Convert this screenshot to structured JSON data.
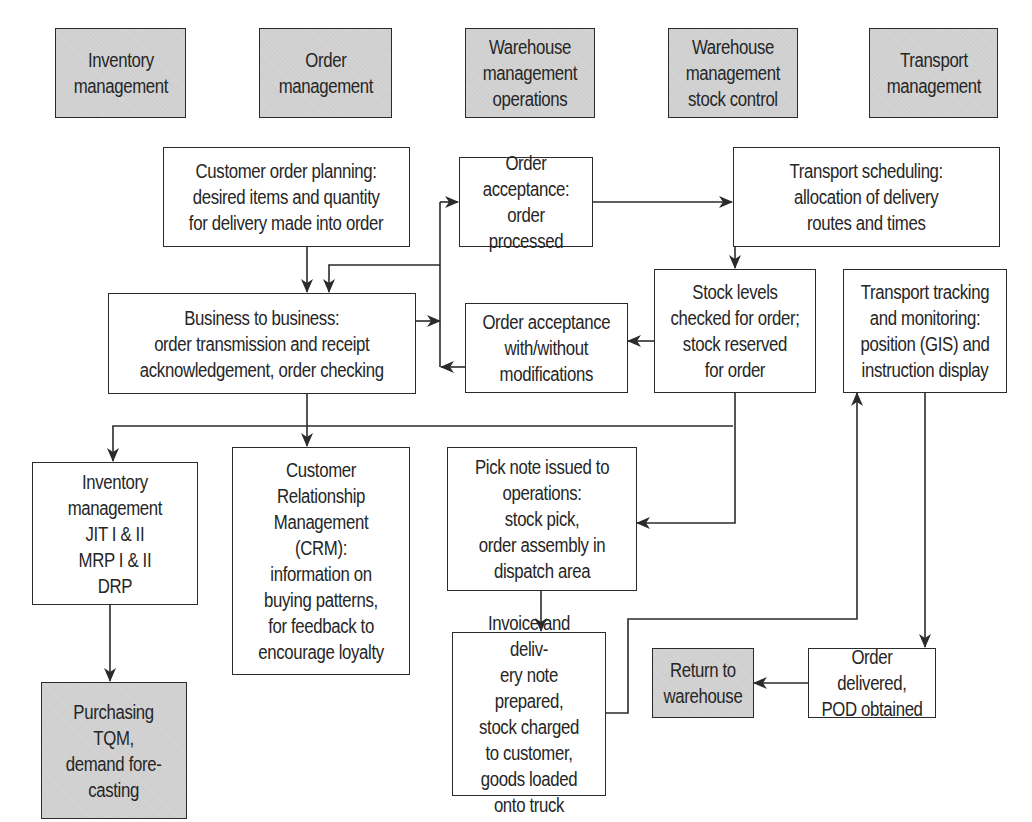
{
  "diagram": {
    "type": "flowchart",
    "colors": {
      "header_fill": "#cfcfcf",
      "process_fill": "#ffffff",
      "line": "#2b2b2b",
      "text": "#262626"
    },
    "headers": [
      {
        "id": "h-inventory",
        "label": "Inventory\nmanagement"
      },
      {
        "id": "h-order",
        "label": "Order\nmanagement"
      },
      {
        "id": "h-wh-ops",
        "label": "Warehouse\nmanagement\noperations"
      },
      {
        "id": "h-wh-stock",
        "label": "Warehouse\nmanagement\nstock control"
      },
      {
        "id": "h-transport",
        "label": "Transport\nmanagement"
      }
    ],
    "nodes": {
      "customer_order_planning": "Customer order planning:\ndesired items and quantity\nfor delivery made into order",
      "order_acceptance_processed": "Order acceptance:\norder processed",
      "transport_scheduling": "Transport scheduling:\nallocation of delivery\nroutes and times",
      "business_to_business": "Business to business:\norder transmission and receipt\nacknowledgement, order checking",
      "order_acceptance_modifications": "Order acceptance\nwith/without\nmodifications",
      "stock_levels": "Stock levels\nchecked for order;\nstock reserved\nfor order",
      "transport_tracking": "Transport tracking\nand monitoring:\nposition (GIS) and\ninstruction display",
      "inventory_jit": "Inventory\nmanagement\nJIT I & II\nMRP I & II\nDRP",
      "crm": "Customer\nRelationship\nManagement\n(CRM):\ninformation on\nbuying patterns,\nfor feedback to\nencourage loyalty",
      "pick_note": "Pick note issued to\noperations:\nstock pick,\norder assembly in\ndispatch area",
      "invoice": "Invoice and deliv-\nery note prepared,\nstock charged\nto customer,\ngoods loaded\nonto truck",
      "return_to_warehouse": "Return to\nwarehouse",
      "order_delivered": "Order delivered,\nPOD obtained",
      "purchasing": "Purchasing\nTQM,\ndemand fore-\ncasting"
    },
    "edges": [
      {
        "from": "customer_order_planning",
        "to": "business_to_business"
      },
      {
        "from": "order_acceptance_processed",
        "to": "business_to_business"
      },
      {
        "from": "business_to_business",
        "to": "order_acceptance_processed"
      },
      {
        "from": "order_acceptance_modifications",
        "to": "business_to_business"
      },
      {
        "from": "order_acceptance_processed",
        "to": "transport_scheduling"
      },
      {
        "from": "order_acceptance_processed",
        "to": "stock_levels"
      },
      {
        "from": "stock_levels",
        "to": "order_acceptance_modifications"
      },
      {
        "from": "business_to_business",
        "to": "inventory_jit"
      },
      {
        "from": "business_to_business",
        "to": "crm"
      },
      {
        "from": "stock_levels",
        "to": "pick_note"
      },
      {
        "from": "pick_note",
        "to": "invoice"
      },
      {
        "from": "invoice",
        "to": "transport_tracking"
      },
      {
        "from": "transport_tracking",
        "to": "order_delivered"
      },
      {
        "from": "order_delivered",
        "to": "return_to_warehouse"
      },
      {
        "from": "inventory_jit",
        "to": "purchasing"
      }
    ]
  }
}
